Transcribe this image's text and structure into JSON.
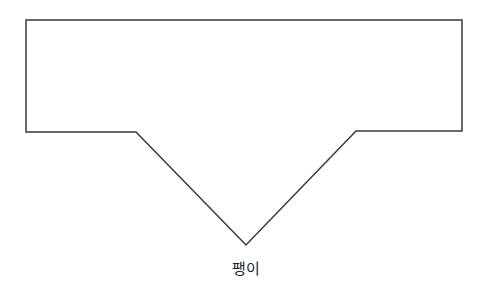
{
  "diagram": {
    "shape": "pentagon-callout",
    "stroke_color": "#3a3a3a",
    "fill_color": "#ffffff",
    "points": "26,20 462,20 462,131 356,131 246,245 136,132 26,132",
    "label": "팽이"
  }
}
